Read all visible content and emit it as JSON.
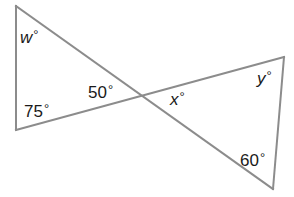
{
  "diagram": {
    "colors": {
      "lines": "#8c8c8c",
      "text": "#1a1a1a",
      "background": "#ffffff"
    },
    "vertices": {
      "left_top": [
        16,
        6
      ],
      "left_bottom": [
        16,
        130
      ],
      "intersection": [
        143,
        96
      ],
      "right_top": [
        284,
        57
      ],
      "right_bottom": [
        273,
        189
      ]
    },
    "labels": {
      "w": {
        "var": "w",
        "deg": "°"
      },
      "a75": {
        "text": "75",
        "deg": "°"
      },
      "a50": {
        "text": "50",
        "deg": "°"
      },
      "x": {
        "var": "x",
        "deg": "°"
      },
      "y": {
        "var": "y",
        "deg": "°"
      },
      "a60": {
        "text": "60",
        "deg": "°"
      }
    }
  }
}
